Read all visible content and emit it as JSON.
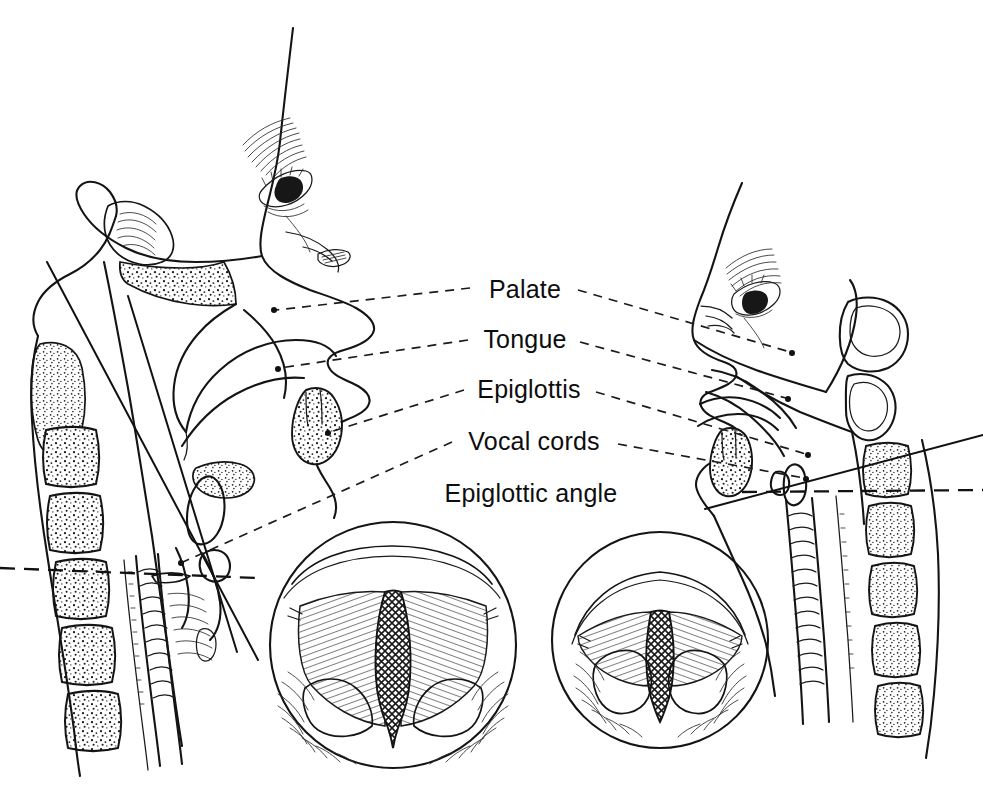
{
  "figure": {
    "background_color": "#ffffff",
    "ink_color": "#141414",
    "width": 983,
    "height": 793
  },
  "labels": [
    {
      "id": "palate",
      "text": "Palate",
      "x": 525,
      "y": 298
    },
    {
      "id": "tongue",
      "text": "Tongue",
      "x": 525,
      "y": 348
    },
    {
      "id": "epiglottis",
      "text": "Epiglottis",
      "x": 529,
      "y": 398
    },
    {
      "id": "vocal_cords",
      "text": "Vocal cords",
      "x": 534,
      "y": 450
    },
    {
      "id": "epiglottic_angle",
      "text": "Epiglottic angle",
      "x": 531,
      "y": 502
    }
  ],
  "panels": {
    "left_head": {
      "name": "Sagittal head and neck, neutral position",
      "description": "Midsagittal section of head and neck showing nasal cavity, hard and soft palate, tongue, epiglottis, larynx, hyoid, cervical vertebrae and trachea"
    },
    "right_head": {
      "name": "Sagittal head and neck, extended position",
      "description": "Midsagittal section with the head tilted back and neck extended, showing the altered epiglottic angle"
    },
    "left_circle": {
      "name": "Laryngoscopic view, neutral position",
      "description": "Endoscopic view of the larynx showing a wide open glottis between the vocal cords"
    },
    "right_circle": {
      "name": "Laryngoscopic view, extended position",
      "description": "Endoscopic view of the larynx showing a narrowed glottic aperture with prominent arytenoid eminences"
    }
  },
  "geometry": {
    "left_circle": {
      "cx": 393,
      "cy": 645,
      "r": 123
    },
    "right_circle": {
      "cx": 660,
      "cy": 640,
      "r": 108
    }
  },
  "colors": {
    "ink": "#141414",
    "background": "#ffffff",
    "leader": "#1b1b1b",
    "reference_line": "#111111"
  }
}
